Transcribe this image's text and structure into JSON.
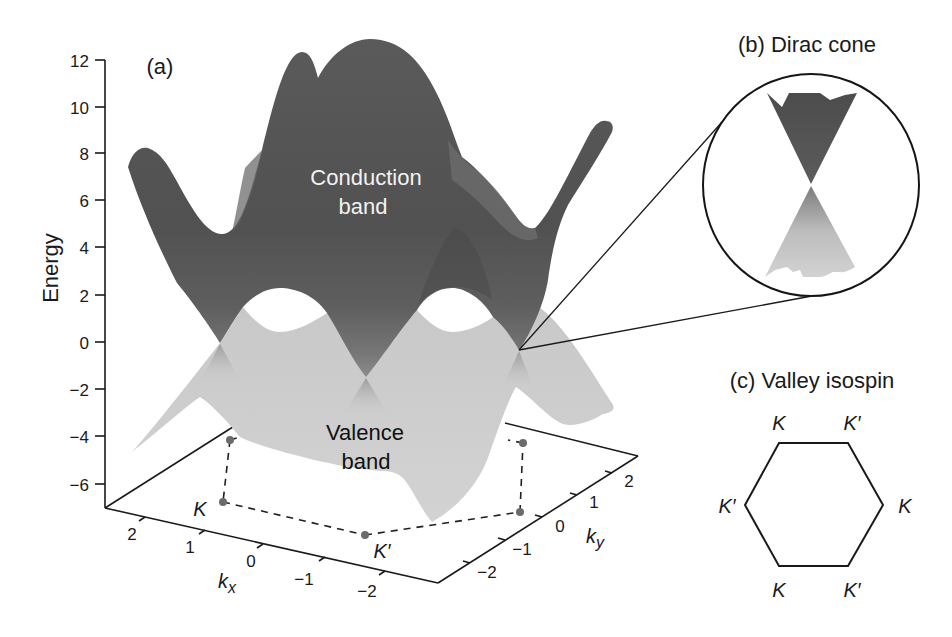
{
  "figure": {
    "panel_a": {
      "label": "(a)",
      "y_axis": {
        "title": "Energy",
        "ticks": [
          "12",
          "10",
          "8",
          "6",
          "4",
          "2",
          "0",
          "−2",
          "−4",
          "−6"
        ]
      },
      "kx_axis": {
        "symbol": "k",
        "subscript": "x",
        "ticks": [
          "2",
          "1",
          "0",
          "−1",
          "−2"
        ]
      },
      "ky_axis": {
        "symbol": "k",
        "subscript": "y",
        "ticks": [
          "−2",
          "−1",
          "0",
          "1",
          "2"
        ]
      },
      "conduction_band_label": {
        "line1": "Conduction",
        "line2": "band"
      },
      "valence_band_label": {
        "line1": "Valence",
        "line2": "band"
      },
      "brillouin_zone_points": {
        "K": "K",
        "K_prime": "K′"
      }
    },
    "panel_b": {
      "title": "(b) Dirac cone"
    },
    "panel_c": {
      "title": "(c) Valley isospin",
      "vertices": {
        "top_left": "K",
        "top_right": "K′",
        "right": "K",
        "bottom_right": "K′",
        "bottom_left": "K",
        "left": "K′"
      }
    }
  },
  "colors": {
    "background": "#ffffff",
    "conduction_band": "#555555",
    "valence_band": "#cfcfcf",
    "lines": "#1a1a1a",
    "markers": "#6b6b6b"
  }
}
